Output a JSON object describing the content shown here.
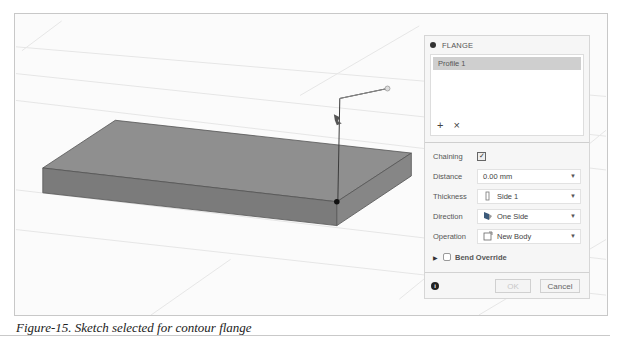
{
  "panel": {
    "title": "FLANGE",
    "profiles": [
      "Profile 1"
    ],
    "list_actions": {
      "add": "+",
      "remove": "×"
    },
    "fields": {
      "chaining": {
        "label": "Chaining",
        "checked": true,
        "mark": "✓"
      },
      "distance": {
        "label": "Distance",
        "value": "0.00 mm"
      },
      "thickness": {
        "label": "Thickness",
        "value": "Side 1"
      },
      "direction": {
        "label": "Direction",
        "value": "One Side"
      },
      "operation": {
        "label": "Operation",
        "value": "New Body"
      }
    },
    "bend_override": {
      "label": "Bend Override",
      "checked": false
    },
    "footer": {
      "info": "i",
      "ok": "OK",
      "cancel": "Cancel"
    },
    "dropdown_caret": "▼",
    "expand_caret": "▶"
  },
  "caption": "Figure-15. Sketch selected for contour flange",
  "colors": {
    "plate_top": "#8e8e8e",
    "plate_front": "#7c7c7c",
    "plate_side": "#858585",
    "sketch_line": "#3a3a3a",
    "panel_bg": "#f6f6f6",
    "selected_item": "#cfcfcf"
  }
}
